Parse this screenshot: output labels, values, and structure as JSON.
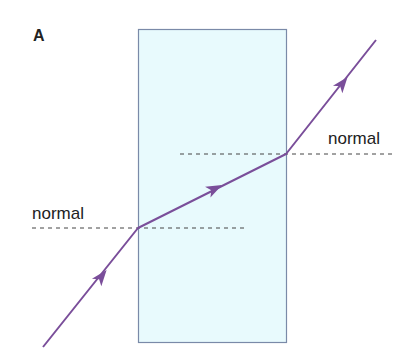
{
  "diagram": {
    "panel_label": "A",
    "normal_left_label": "normal",
    "normal_right_label": "normal",
    "colors": {
      "block_fill": "#e8fafd",
      "block_stroke": "#7a8aa8",
      "ray": "#7a4e9a",
      "normal_line": "#444444",
      "text": "#222222"
    },
    "block": {
      "x": 138,
      "y": 29,
      "width": 148,
      "height": 314
    },
    "ray_points": {
      "start": [
        43,
        347
      ],
      "entry": [
        138,
        228
      ],
      "exit": [
        286,
        154
      ],
      "end": [
        376,
        40
      ]
    },
    "normals": {
      "left": {
        "x1": 32,
        "x2": 244,
        "y": 228
      },
      "right": {
        "x1": 180,
        "x2": 394,
        "y": 154
      }
    }
  }
}
